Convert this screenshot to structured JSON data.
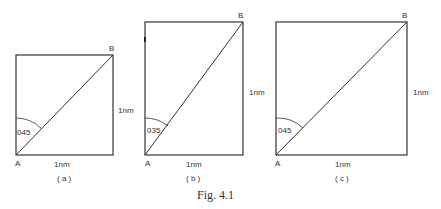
{
  "figure": {
    "caption": "Fig. 4.1",
    "panels": [
      {
        "id": "a",
        "label": "( a )",
        "point_start": "A",
        "point_end": "B",
        "angle_label": "045",
        "width_label": "1nm",
        "height_label": "1nm"
      },
      {
        "id": "b",
        "label": "( b )",
        "point_start": "A",
        "point_end": "B",
        "angle_label": "035",
        "width_label": "1nm",
        "height_label": "1nm"
      },
      {
        "id": "c",
        "label": "( c )",
        "point_start": "A",
        "point_end": "B",
        "angle_label": "045",
        "width_label": "1nm",
        "height_label": "1nm"
      }
    ]
  },
  "colors": {
    "line": "#333333"
  }
}
